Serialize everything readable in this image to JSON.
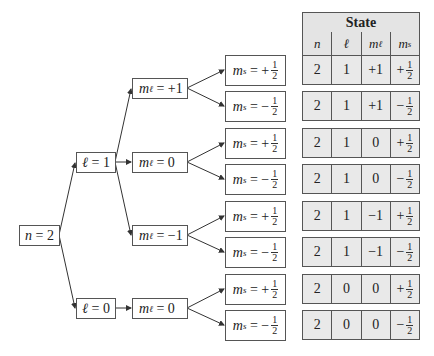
{
  "diagram": {
    "root": {
      "var": "n",
      "value": "2",
      "label": "n = 2"
    },
    "l_nodes": [
      {
        "var": "ℓ",
        "value": "1",
        "label": "ℓ = 1"
      },
      {
        "var": "ℓ",
        "value": "0",
        "label": "ℓ = 0"
      }
    ],
    "ml_nodes": [
      {
        "var": "m",
        "sub": "ℓ",
        "eq": "=",
        "value": "+1"
      },
      {
        "var": "m",
        "sub": "ℓ",
        "eq": "=",
        "value": "0"
      },
      {
        "var": "m",
        "sub": "ℓ",
        "eq": "=",
        "value": "−1"
      },
      {
        "var": "m",
        "sub": "ℓ",
        "eq": "=",
        "value": "0"
      }
    ],
    "ms_nodes": [
      {
        "var": "m",
        "sub": "s",
        "eq": "=",
        "sign": "+",
        "num": "1",
        "den": "2"
      },
      {
        "var": "m",
        "sub": "s",
        "eq": "=",
        "sign": "−",
        "num": "1",
        "den": "2"
      },
      {
        "var": "m",
        "sub": "s",
        "eq": "=",
        "sign": "+",
        "num": "1",
        "den": "2"
      },
      {
        "var": "m",
        "sub": "s",
        "eq": "=",
        "sign": "−",
        "num": "1",
        "den": "2"
      },
      {
        "var": "m",
        "sub": "s",
        "eq": "=",
        "sign": "+",
        "num": "1",
        "den": "2"
      },
      {
        "var": "m",
        "sub": "s",
        "eq": "=",
        "sign": "−",
        "num": "1",
        "den": "2"
      },
      {
        "var": "m",
        "sub": "s",
        "eq": "=",
        "sign": "+",
        "num": "1",
        "den": "2"
      },
      {
        "var": "m",
        "sub": "s",
        "eq": "=",
        "sign": "−",
        "num": "1",
        "den": "2"
      }
    ]
  },
  "table": {
    "title": "State",
    "headers": [
      {
        "var": "n",
        "sub": ""
      },
      {
        "var": "ℓ",
        "sub": ""
      },
      {
        "var": "m",
        "sub": "ℓ"
      },
      {
        "var": "m",
        "sub": "s"
      }
    ],
    "rows": [
      {
        "n": "2",
        "l": "1",
        "ml": "+1",
        "ms_sign": "+",
        "ms_num": "1",
        "ms_den": "2"
      },
      {
        "n": "2",
        "l": "1",
        "ml": "+1",
        "ms_sign": "−",
        "ms_num": "1",
        "ms_den": "2"
      },
      {
        "n": "2",
        "l": "1",
        "ml": "0",
        "ms_sign": "+",
        "ms_num": "1",
        "ms_den": "2"
      },
      {
        "n": "2",
        "l": "1",
        "ml": "0",
        "ms_sign": "−",
        "ms_num": "1",
        "ms_den": "2"
      },
      {
        "n": "2",
        "l": "1",
        "ml": "−1",
        "ms_sign": "+",
        "ms_num": "1",
        "ms_den": "2"
      },
      {
        "n": "2",
        "l": "1",
        "ml": "−1",
        "ms_sign": "−",
        "ms_num": "1",
        "ms_den": "2"
      },
      {
        "n": "2",
        "l": "0",
        "ml": "0",
        "ms_sign": "+",
        "ms_num": "1",
        "ms_den": "2"
      },
      {
        "n": "2",
        "l": "0",
        "ml": "0",
        "ms_sign": "−",
        "ms_num": "1",
        "ms_den": "2"
      }
    ]
  }
}
